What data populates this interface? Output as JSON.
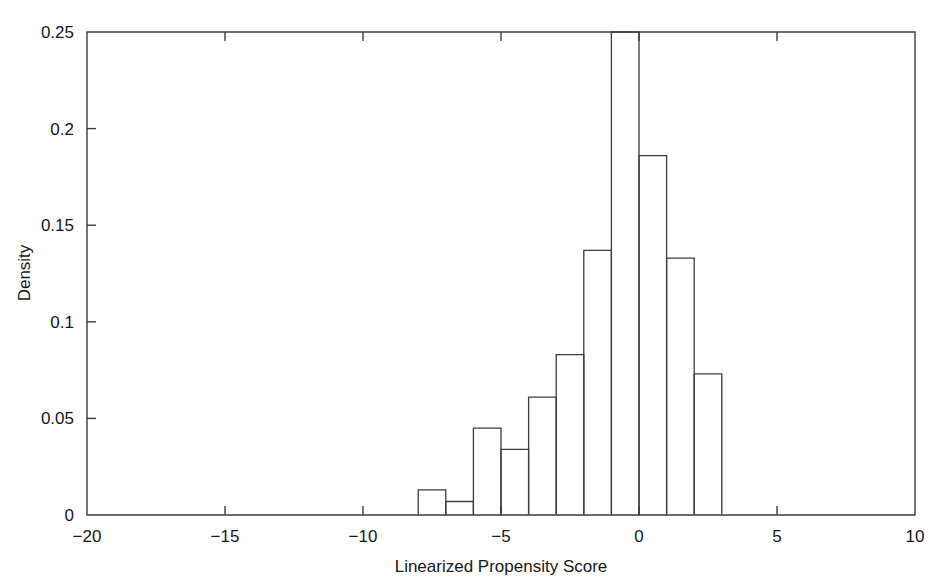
{
  "figure": {
    "background_color": "#ffffff",
    "axis_color": "#3c3c3c",
    "bar_fill": "none",
    "bar_stroke": "#3c3c3c"
  },
  "axes": {
    "x_title": "Linearized Propensity Score",
    "y_title": "Density",
    "x_ticks": [
      "-20",
      "-15",
      "-10",
      "-5",
      "0",
      "5",
      "10"
    ],
    "y_ticks": [
      "0",
      "0.05",
      "0.1",
      "0.15",
      "0.2",
      "0.25"
    ]
  },
  "caption": {
    "partial_text": ""
  },
  "chart_data": {
    "type": "bar",
    "title": "",
    "subtitle": "",
    "xlabel": "Linearized Propensity Score",
    "ylabel": "Density",
    "xlim": [
      -20,
      10
    ],
    "ylim": [
      0,
      0.25
    ],
    "xticks": [
      -20,
      -15,
      -10,
      -5,
      0,
      5,
      10
    ],
    "yticks": [
      0,
      0.05,
      0.1,
      0.15,
      0.2,
      0.25
    ],
    "grid": false,
    "legend": "none",
    "bin_width": 1,
    "bin_edges": [
      -8,
      -7,
      -6,
      -5,
      -4,
      -3,
      -2,
      -1,
      0,
      1,
      2,
      3
    ],
    "categories": [
      "-8 to -7",
      "-7 to -6",
      "-6 to -5",
      "-5 to -4",
      "-4 to -3",
      "-3 to -2",
      "-2 to -1",
      "-1 to 0",
      "0 to 1",
      "1 to 2",
      "2 to 3"
    ],
    "values": [
      0.013,
      0.007,
      0.045,
      0.034,
      0.061,
      0.083,
      0.137,
      0.251,
      0.186,
      0.133,
      0.073
    ],
    "bars": [
      {
        "x0": -8,
        "x1": -7,
        "density": 0.013
      },
      {
        "x0": -7,
        "x1": -6,
        "density": 0.007
      },
      {
        "x0": -6,
        "x1": -5,
        "density": 0.045
      },
      {
        "x0": -5,
        "x1": -4,
        "density": 0.034
      },
      {
        "x0": -4,
        "x1": -3,
        "density": 0.061
      },
      {
        "x0": -3,
        "x1": -2,
        "density": 0.083
      },
      {
        "x0": -2,
        "x1": -1,
        "density": 0.137
      },
      {
        "x0": -1,
        "x1": 0,
        "density": 0.251
      },
      {
        "x0": 0,
        "x1": 1,
        "density": 0.186
      },
      {
        "x0": 1,
        "x1": 2,
        "density": 0.133
      },
      {
        "x0": 2,
        "x1": 3,
        "density": 0.073
      }
    ]
  }
}
